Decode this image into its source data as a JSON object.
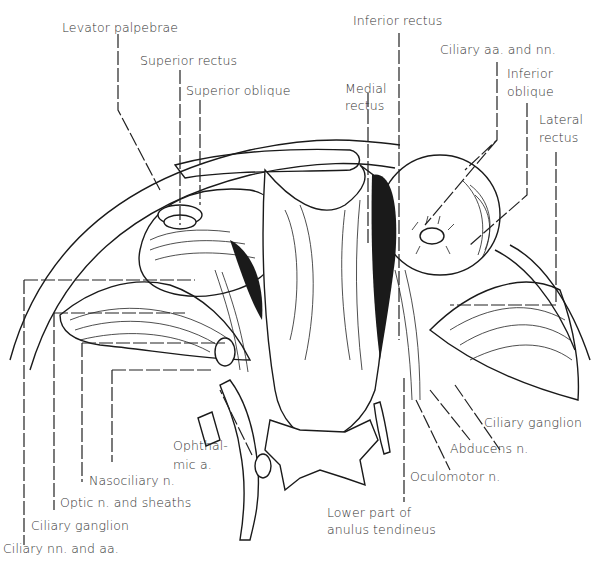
{
  "figure": {
    "labels": {
      "levator_palpebrae": "Levator palpebrae",
      "superior_rectus": "Superior rectus",
      "superior_oblique": "Superior oblique",
      "inferior_rectus": "Inferior rectus",
      "medial_rectus_1": "Medial",
      "medial_rectus_2": "rectus",
      "ciliary_aa_nn": "Ciliary aa. and nn.",
      "inferior_oblique_1": "Inferior",
      "inferior_oblique_2": "oblique",
      "lateral_rectus_1": "Lateral",
      "lateral_rectus_2": "rectus",
      "ophthalmic_a_1": "Ophthal-",
      "ophthalmic_a_2": "mic a.",
      "nasociliary_n": "Nasociliary n.",
      "optic_n_sheaths": "Optic n. and sheaths",
      "ciliary_ganglion_left": "Ciliary ganglion",
      "ciliary_nn_aa": "Ciliary nn. and aa.",
      "ciliary_ganglion_right": "Ciliary ganglion",
      "abducens_n": "Abducens n.",
      "oculomotor_n": "Oculomotor n.",
      "anulus_1": "Lower part of",
      "anulus_2": "anulus tendineus"
    }
  }
}
